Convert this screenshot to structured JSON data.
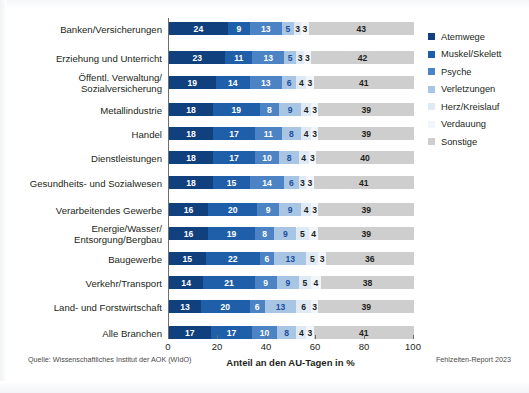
{
  "chart_data": {
    "type": "bar",
    "orientation": "horizontal",
    "stacked": true,
    "title": "",
    "xlabel": "Anteil an den AU-Tagen in %",
    "ylabel": "",
    "xlim": [
      0,
      100
    ],
    "xticks": [
      0,
      20,
      40,
      60,
      80,
      100
    ],
    "grid": false,
    "legend_position": "right",
    "categories": [
      "Banken/Versicherungen",
      "Erziehung und Unterricht",
      "Öffentl. Verwaltung/\nSozialversicherung",
      "Metallindustrie",
      "Handel",
      "Dienstleistungen",
      "Gesundheits- und Sozialwesen",
      "Verarbeitendes Gewerbe",
      "Energie/Wasser/\nEntsorgung/Bergbau",
      "Baugewerbe",
      "Verkehr/Transport",
      "Land- und Forstwirtschaft",
      "Alle Branchen"
    ],
    "series": [
      {
        "name": "Atemwege",
        "color": "#11407f",
        "values": [
          24,
          23,
          19,
          18,
          18,
          18,
          18,
          16,
          16,
          15,
          14,
          13,
          17
        ]
      },
      {
        "name": "Muskel/Skelett",
        "color": "#1f5fa9",
        "values": [
          9,
          11,
          14,
          19,
          17,
          17,
          15,
          20,
          19,
          22,
          21,
          20,
          17
        ]
      },
      {
        "name": "Psyche",
        "color": "#4b83c4",
        "values": [
          13,
          13,
          13,
          8,
          11,
          10,
          14,
          9,
          8,
          6,
          9,
          6,
          10
        ]
      },
      {
        "name": "Verletzungen",
        "color": "#a8c6e4",
        "values": [
          5,
          5,
          6,
          9,
          8,
          8,
          6,
          9,
          9,
          13,
          9,
          13,
          8
        ]
      },
      {
        "name": "Herz/Kreislauf",
        "color": "#dfeaf5",
        "values": [
          3,
          3,
          4,
          4,
          4,
          4,
          3,
          4,
          5,
          5,
          5,
          6,
          4
        ]
      },
      {
        "name": "Verdauung",
        "color": "#f2f6fb",
        "values": [
          3,
          3,
          3,
          3,
          3,
          3,
          3,
          3,
          4,
          3,
          4,
          3,
          3
        ]
      },
      {
        "name": "Sonstige",
        "color": "#cecece",
        "values": [
          43,
          42,
          41,
          39,
          39,
          40,
          41,
          39,
          39,
          36,
          38,
          39,
          41
        ]
      }
    ]
  },
  "legend": {
    "items": [
      {
        "label": "Atemwege",
        "color": "#11407f"
      },
      {
        "label": "Muskel/Skelett",
        "color": "#1f5fa9"
      },
      {
        "label": "Psyche",
        "color": "#4b83c4"
      },
      {
        "label": "Verletzungen",
        "color": "#a8c6e4"
      },
      {
        "label": "Herz/Kreislauf",
        "color": "#dfeaf5"
      },
      {
        "label": "Verdauung",
        "color": "#f2f6fb"
      },
      {
        "label": "Sonstige",
        "color": "#cecece"
      }
    ]
  },
  "footer": {
    "source": "Quelle: Wissenschaftliches Institut der AOK (WIdO)",
    "report": "Fehlzeiten-Report 2023"
  }
}
